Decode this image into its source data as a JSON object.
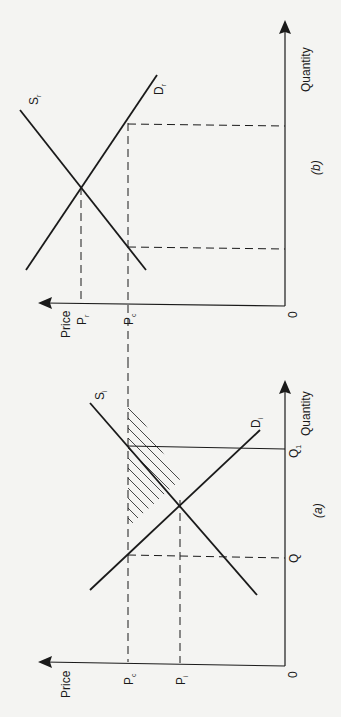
{
  "figure": {
    "orientation": "rotated 90 degrees counter-clockwise",
    "colors": {
      "ink": "#1a1a1a",
      "paper": "#f4f4f2"
    },
    "panels": [
      {
        "id": "a",
        "caption": "(a)",
        "y_axis_label": "Price",
        "x_axis_label": "Quantity",
        "origin_label": "0",
        "price_ticks": [
          {
            "label": "P",
            "sub": "c"
          },
          {
            "label": "P",
            "sub": "i"
          }
        ],
        "quantity_ticks": [
          {
            "label": "Q",
            "sub": ""
          },
          {
            "label": "Q",
            "sub": "1"
          }
        ],
        "curves": [
          {
            "label": "S",
            "sub": "i"
          },
          {
            "label": "D",
            "sub": "i"
          }
        ],
        "shaded_region": "triangle between Pc, supply and demand"
      },
      {
        "id": "b",
        "caption": "(b)",
        "y_axis_label": "Price",
        "x_axis_label": "Quantity",
        "origin_label": "0",
        "price_ticks": [
          {
            "label": "P",
            "sub": "r"
          },
          {
            "label": "P",
            "sub": "c"
          }
        ],
        "curves": [
          {
            "label": "S",
            "sub": "r"
          },
          {
            "label": "D",
            "sub": "r"
          }
        ]
      }
    ]
  }
}
